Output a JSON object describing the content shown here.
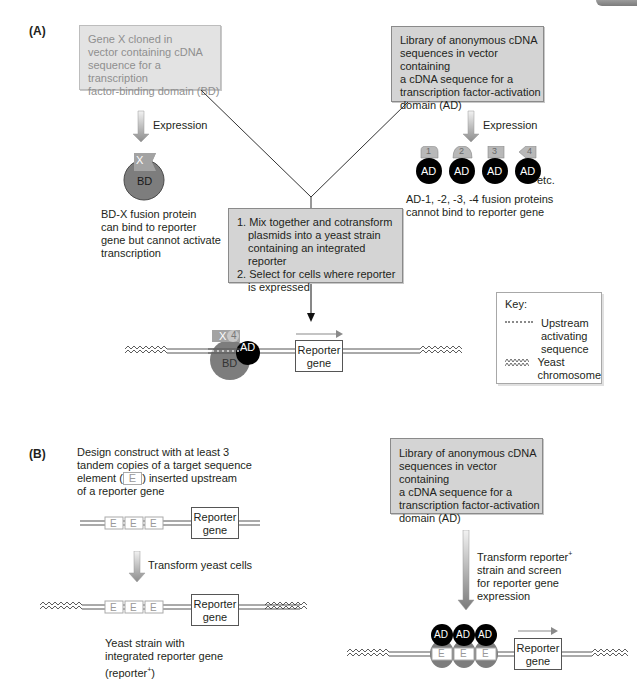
{
  "panel_a": {
    "label": "(A)",
    "gene_x_box": [
      "Gene X cloned in",
      "vector containing cDNA",
      "sequence for a transcription",
      "factor-binding domain (BD)"
    ],
    "library_box": [
      "Library of anonymous cDNA",
      "sequences in vector containing",
      "a cDNA sequence for a",
      "transcription factor-activation",
      "domain (AD)"
    ],
    "expression_left": "Expression",
    "expression_right": "Expression",
    "bd_protein": {
      "tag": "X",
      "domain": "BD"
    },
    "bd_caption": [
      "BD-X fusion protein",
      "can bind to reporter",
      "gene but cannot activate",
      "transcription"
    ],
    "ad_proteins": [
      {
        "tag": "1",
        "domain": "AD"
      },
      {
        "tag": "2",
        "domain": "AD"
      },
      {
        "tag": "3",
        "domain": "AD"
      },
      {
        "tag": "4",
        "domain": "AD"
      }
    ],
    "ad_etc": "etc.",
    "ad_caption": [
      "AD-1, -2, -3, -4 fusion proteins",
      "cannot bind to reporter gene"
    ],
    "steps_box": [
      "1. Mix together and cotransform",
      "plasmids into a yeast strain",
      "containing an integrated reporter",
      "2. Select for cells where reporter",
      "is expressed"
    ],
    "complex": {
      "x_tag": "X",
      "ad_tag": "4",
      "ad": "AD",
      "bd": "BD"
    },
    "reporter": [
      "Reporter",
      "gene"
    ],
    "key": {
      "title": "Key:",
      "uas_label": [
        "Upstream",
        "activating",
        "sequence"
      ],
      "chromosome_label": [
        "Yeast",
        "chromosome"
      ]
    }
  },
  "panel_b": {
    "label": "(B)",
    "design_text": [
      "Design construct with at least 3",
      "tandem copies of a target sequence",
      "element (",
      "E",
      ") inserted upstream",
      "of a reporter gene"
    ],
    "element": "E",
    "reporter": [
      "Reporter",
      "gene"
    ],
    "transform_label": "Transform yeast cells",
    "strain_caption": [
      "Yeast strain with",
      "integrated reporter gene",
      "(reporter",
      "+",
      ")"
    ],
    "library_box": [
      "Library of anonymous cDNA",
      "sequences in vector containing",
      "a cDNA sequence for a",
      "transcription factor-activation",
      "domain (AD)"
    ],
    "screen_label": [
      "Transform reporter",
      "+",
      "strain and screen",
      "for reporter gene",
      "expression"
    ],
    "bound_ad": [
      "AD",
      "AD",
      "AD"
    ]
  },
  "colors": {
    "box_fill": "#d4d4d4",
    "faded_box_fill": "#e3e3e3",
    "bd_gray": "#7d7d7d",
    "ad_black": "#000000",
    "tag_gray": "#b5b5b5",
    "arrow_gray": "#8c8c8c"
  }
}
